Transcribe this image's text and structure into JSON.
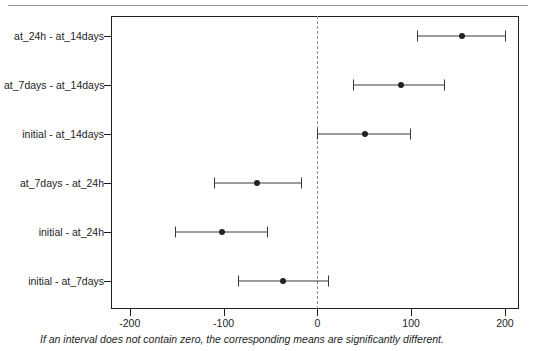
{
  "chart_data": {
    "type": "scatter",
    "title": "",
    "subtitle": "",
    "xlabel": "",
    "ylabel": "",
    "xlim": [
      -220,
      215
    ],
    "xticks": [
      -200,
      -100,
      0,
      100,
      200
    ],
    "xticklabels": [
      "-200",
      "-100",
      "0",
      "100",
      "200"
    ],
    "grid": false,
    "legend_position": "none",
    "reference_line": 0,
    "reference_line_style": "dashed",
    "annotation": "If an interval does not contain zero, the corresponding means are significantly different.",
    "categories": [
      "at_24h - at_14days",
      "at_7days - at_14days",
      "initial - at_14days",
      "at_7days - at_24h",
      "initial - at_24h",
      "initial - at_7days"
    ],
    "series": [
      {
        "name": "difference of means with 95% CI",
        "points": [
          {
            "label": "at_24h - at_14days",
            "center": 154,
            "lower": 106,
            "upper": 200
          },
          {
            "label": "at_7days - at_14days",
            "center": 89,
            "lower": 38,
            "upper": 135
          },
          {
            "label": "initial - at_14days",
            "center": 51,
            "lower": 0,
            "upper": 99
          },
          {
            "label": "at_7days - at_24h",
            "center": -64,
            "lower": -110,
            "upper": -17
          },
          {
            "label": "initial - at_24h",
            "center": -102,
            "lower": -152,
            "upper": -54
          },
          {
            "label": "initial - at_7days",
            "center": -37,
            "lower": -85,
            "upper": 11
          }
        ]
      }
    ]
  },
  "colors": {
    "frame": "#1e1e1e",
    "interval": "#3a3a3a",
    "point": "#222222",
    "zero_line": "#8d8d8d",
    "top_rule": "#9a9a9a",
    "text": "#1e1e1e"
  }
}
